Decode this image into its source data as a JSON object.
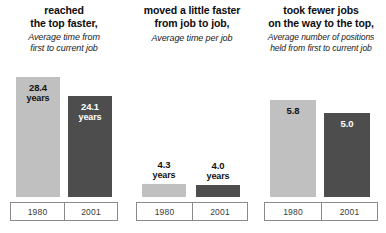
{
  "chart_data": {
    "type": "bar",
    "title": "",
    "categories": [
      "1980",
      "2001"
    ],
    "grid": false,
    "legend": "none",
    "colors": {
      "1980": "#c0c0c0",
      "2001": "#4d4d4d",
      "text": "#111111",
      "axis_border": "#8a8a8a"
    },
    "panels": [
      {
        "title": "reached\nthe top faster,",
        "subtitle": "Average time from\nfirst to current job",
        "ylabel": "years",
        "categories": [
          "1980",
          "2001"
        ],
        "values": [
          28.4,
          24.1
        ],
        "value_labels": [
          "28.4",
          "24.1"
        ],
        "unit_labels": [
          "years",
          "years"
        ],
        "label_position": "inside"
      },
      {
        "title": "moved a little faster\nfrom job to job,",
        "subtitle": "Average time per job",
        "ylabel": "years",
        "categories": [
          "1980",
          "2001"
        ],
        "values": [
          4.3,
          4.0
        ],
        "value_labels": [
          "4.3",
          "4.0"
        ],
        "unit_labels": [
          "years",
          "years"
        ],
        "label_position": "above"
      },
      {
        "title": "took fewer jobs\non the way to the top,",
        "subtitle": "Average number of positions\nheld from first to current job",
        "ylabel": "",
        "categories": [
          "1980",
          "2001"
        ],
        "values": [
          5.8,
          5.0
        ],
        "value_labels": [
          "5.8",
          "5.0"
        ],
        "unit_labels": [
          "",
          ""
        ],
        "label_position": "inside"
      }
    ]
  }
}
